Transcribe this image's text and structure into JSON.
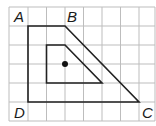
{
  "diagram": {
    "grid": {
      "x_lines": [
        9,
        28,
        46.5,
        65,
        83.5,
        102,
        120.5,
        139,
        155
      ],
      "y_lines": [
        7,
        26,
        45,
        64,
        83,
        102,
        121
      ],
      "color": "#bdbdbd"
    },
    "outer_shape": {
      "name": "ABCD",
      "points": "28,26 65,26 139,102 28,102",
      "stroke": "#222222"
    },
    "inner_shape": {
      "points": "46.5,45 65,45 102,83 46.5,83",
      "stroke": "#222222"
    },
    "center_point": {
      "cx": 65,
      "cy": 64,
      "r": 3,
      "fill": "#111111"
    },
    "labels": {
      "A": {
        "text": "A",
        "x": 14,
        "y": 22
      },
      "B": {
        "text": "B",
        "x": 67,
        "y": 22
      },
      "C": {
        "text": "C",
        "x": 142,
        "y": 118
      },
      "D": {
        "text": "D",
        "x": 14,
        "y": 118
      }
    }
  }
}
